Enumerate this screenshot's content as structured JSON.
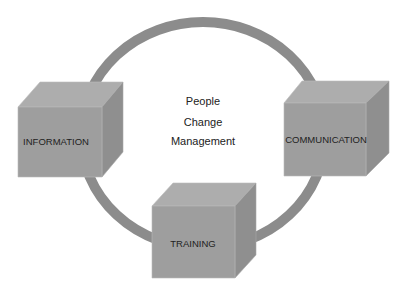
{
  "diagram": {
    "center_lines": [
      "People",
      "Change",
      "Management"
    ],
    "nodes": [
      {
        "id": "information",
        "label": "INFORMATION",
        "position": "left"
      },
      {
        "id": "communication",
        "label": "COMMUNICATION",
        "position": "right"
      },
      {
        "id": "training",
        "label": "TRAINING",
        "position": "bottom"
      }
    ],
    "colors": {
      "ring": "#8c8c8c",
      "cube_top": "#adadad",
      "cube_front": "#9e9e9e",
      "cube_side": "#8f8f8f",
      "text": "#222222"
    }
  }
}
